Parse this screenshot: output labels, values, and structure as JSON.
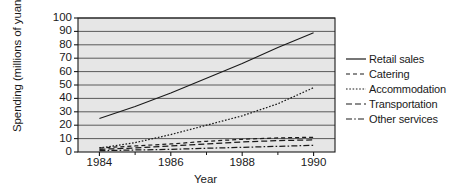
{
  "chart_data": {
    "type": "line",
    "title": "",
    "xlabel": "Year",
    "ylabel": "Spending (millions of yuan)",
    "x": [
      1984,
      1985,
      1986,
      1987,
      1988,
      1989,
      1990
    ],
    "xlim": [
      1983.4,
      1990.6
    ],
    "ylim": [
      0,
      100
    ],
    "xticks": [
      1984,
      1986,
      1988,
      1990
    ],
    "xticklabels": [
      "1984",
      "1986",
      "1988",
      "1990"
    ],
    "xminorticks": [
      1985,
      1987,
      1989
    ],
    "yticks": [
      0,
      10,
      20,
      30,
      40,
      50,
      60,
      70,
      80,
      90,
      100
    ],
    "yticklabels": [
      "0",
      "10",
      "20",
      "30",
      "40",
      "50",
      "60",
      "70",
      "80",
      "90",
      "100"
    ],
    "grid": "horizontal",
    "legend_position": "right",
    "plot_background": "#e6e6e6",
    "line_color": "#1a1a1a",
    "series": [
      {
        "name": "Retail sales",
        "style": "solid",
        "values": [
          25,
          34,
          44,
          55,
          66,
          78,
          89
        ]
      },
      {
        "name": "Catering",
        "style": "dashed",
        "values": [
          3,
          4.5,
          6,
          8,
          9.5,
          10.5,
          11
        ]
      },
      {
        "name": "Accommodation",
        "style": "dotted",
        "values": [
          3,
          7,
          13,
          20,
          27,
          36,
          48
        ]
      },
      {
        "name": "Transportation",
        "style": "dash-long",
        "values": [
          2,
          3,
          4.5,
          6,
          7.5,
          8.5,
          9
        ]
      },
      {
        "name": "Other services",
        "style": "dash-dot",
        "values": [
          1,
          1.5,
          2,
          2.8,
          3.5,
          4.2,
          5
        ]
      }
    ]
  },
  "legend": {
    "items": [
      {
        "label": "Retail sales"
      },
      {
        "label": "Catering"
      },
      {
        "label": "Accommodation"
      },
      {
        "label": "Transportation"
      },
      {
        "label": "Other services"
      }
    ]
  }
}
